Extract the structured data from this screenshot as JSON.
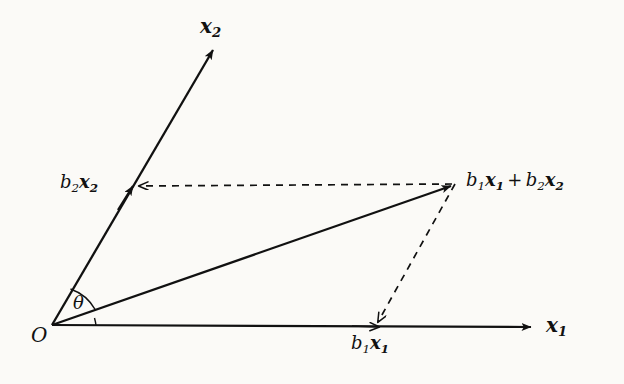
{
  "figure": {
    "background_color": "#fbfaf7",
    "stroke_color": "#111111"
  },
  "labels": {
    "axis_x1": {
      "base": "x",
      "sub": "1"
    },
    "axis_x2": {
      "base": "x",
      "sub": "2"
    },
    "origin": "O",
    "angle": "θ",
    "b2x2": {
      "coef": "b",
      "coef_sub": "2",
      "base": "x",
      "sub": "2"
    },
    "b1x1": {
      "coef": "b",
      "coef_sub": "1",
      "base": "x",
      "sub": "1"
    },
    "sum": {
      "term1_coef": "b",
      "term1_coef_sub": "1",
      "term1_base": "x",
      "term1_sub": "1",
      "operator": "+",
      "term2_coef": "b",
      "term2_coef_sub": "2",
      "term2_base": "x",
      "term2_sub": "2"
    }
  },
  "geometry": {
    "origin": [
      52,
      325
    ],
    "x1_axis_tip": [
      535,
      327
    ],
    "x2_axis_tip": [
      216,
      45
    ],
    "resultant_tip": [
      455,
      184
    ],
    "b1x1_point": [
      377,
      327
    ],
    "b2x2_point": [
      133,
      186
    ],
    "angle_arc_degrees": 39
  }
}
